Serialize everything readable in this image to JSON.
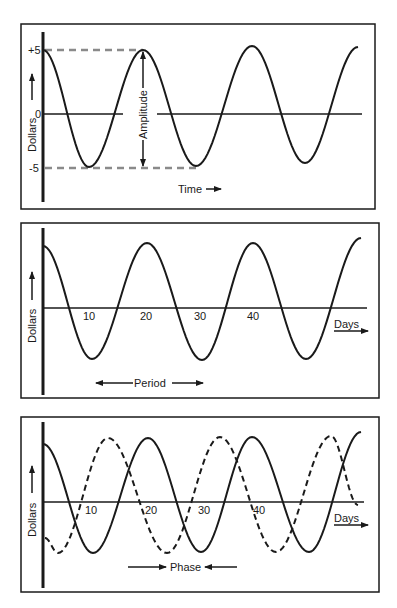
{
  "figure": {
    "background": "#ffffff",
    "ink": "#1a1a1a",
    "dash_color": "#8a8a8a"
  },
  "chart_data": [
    {
      "type": "line",
      "title": "Amplitude",
      "ylabel": "Dollars",
      "xlabel": "Time",
      "yticks": [
        "+5",
        "0",
        "-5"
      ],
      "ylim": [
        -5,
        5
      ],
      "annotations": [
        "Amplitude"
      ],
      "series": [
        {
          "name": "wave",
          "style": "solid",
          "points_px": [
            [
              43,
              50
            ],
            [
              89,
              167
            ],
            [
              143,
              50
            ],
            [
              196,
              166
            ],
            [
              252,
              46
            ],
            [
              305,
              163
            ],
            [
              358,
              47
            ]
          ]
        }
      ],
      "reference_lines": [
        {
          "label": "+5",
          "value": 5,
          "style": "dashed"
        },
        {
          "label": "-5",
          "value": -5,
          "style": "dashed"
        }
      ]
    },
    {
      "type": "line",
      "title": "Period",
      "ylabel": "Dollars",
      "xlabel": "Days",
      "xticks": [
        "10",
        "20",
        "30",
        "40"
      ],
      "annotations": [
        "Period"
      ],
      "series": [
        {
          "name": "wave",
          "style": "solid",
          "points_px": [
            [
              43,
              246
            ],
            [
              92,
              359
            ],
            [
              147,
              243
            ],
            [
              202,
              360
            ],
            [
              253,
              243
            ],
            [
              306,
              359
            ],
            [
              361,
              238
            ]
          ]
        }
      ]
    },
    {
      "type": "line",
      "title": "Phase",
      "ylabel": "Dollars",
      "xlabel": "Days",
      "xticks": [
        "10",
        "20",
        "30",
        "40"
      ],
      "annotations": [
        "Phase"
      ],
      "series": [
        {
          "name": "wave-a",
          "style": "solid",
          "points_px": [
            [
              43,
              444
            ],
            [
              93,
              553
            ],
            [
              148,
              438
            ],
            [
              201,
              552
            ],
            [
              252,
              437
            ],
            [
              309,
              552
            ],
            [
              361,
              432
            ]
          ]
        },
        {
          "name": "wave-b",
          "style": "dashed",
          "points_px": [
            [
              45,
              538
            ],
            [
              58,
              553
            ],
            [
              108,
              438
            ],
            [
              167,
              553
            ],
            [
              220,
              437
            ],
            [
              276,
              552
            ],
            [
              331,
              436
            ],
            [
              358,
              505
            ]
          ]
        }
      ]
    }
  ],
  "panel1": {
    "ylabel": "Dollars",
    "y_plus": "+5",
    "y_zero": "0",
    "y_minus": "-5",
    "amplitude": "Amplitude",
    "time": "Time"
  },
  "panel2": {
    "ylabel": "Dollars",
    "ticks": [
      "10",
      "20",
      "30",
      "40"
    ],
    "days": "Days",
    "period": "Period"
  },
  "panel3": {
    "ylabel": "Dollars",
    "ticks": [
      "10",
      "20",
      "30",
      "40"
    ],
    "days": "Days",
    "phase": "Phase"
  }
}
